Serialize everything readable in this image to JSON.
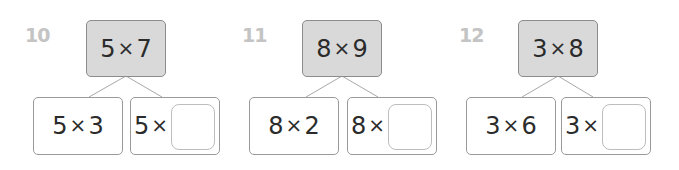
{
  "problems": [
    {
      "number": "10",
      "whole": {
        "a": "5",
        "op": "×",
        "b": "7"
      },
      "part_left": {
        "a": "5",
        "op": "×",
        "b": "3"
      },
      "part_right": {
        "a": "5",
        "op": "×",
        "blank": ""
      }
    },
    {
      "number": "11",
      "whole": {
        "a": "8",
        "op": "×",
        "b": "9"
      },
      "part_left": {
        "a": "8",
        "op": "×",
        "b": "2"
      },
      "part_right": {
        "a": "8",
        "op": "×",
        "blank": ""
      }
    },
    {
      "number": "12",
      "whole": {
        "a": "3",
        "op": "×",
        "b": "8"
      },
      "part_left": {
        "a": "3",
        "op": "×",
        "b": "6"
      },
      "part_right": {
        "a": "3",
        "op": "×",
        "blank": ""
      }
    }
  ],
  "colors": {
    "whole_fill": "#d9d9d9",
    "number_label": "#c4c4c4",
    "text": "#2b2b2b"
  }
}
